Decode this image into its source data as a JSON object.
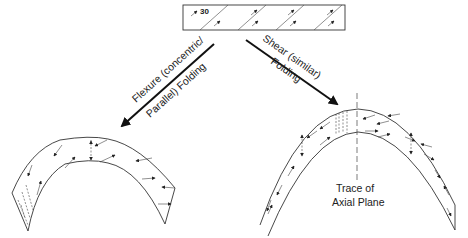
{
  "diagram": {
    "original_bed": {
      "angle_label": "30"
    },
    "left_branch": {
      "label_line1": "Flexure (concentric/",
      "label_line2": "Parallel) Folding"
    },
    "right_branch": {
      "label_line1": "Shear (similar)",
      "label_line2": "Folding"
    },
    "axial_plane": {
      "label_line1": "Trace of",
      "label_line2": "Axial Plane"
    },
    "colors": {
      "line": "#333333",
      "background": "#ffffff"
    }
  }
}
